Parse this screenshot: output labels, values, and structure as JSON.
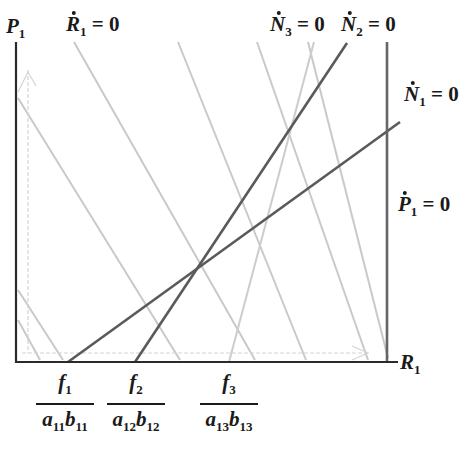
{
  "axes": {
    "y_label": "P",
    "y_label_sub": "1",
    "x_label": "R",
    "x_label_sub": "1"
  },
  "isoclines": {
    "r1": {
      "var": "R",
      "sub": "1",
      "eq": " = 0"
    },
    "n3": {
      "var": "N",
      "sub": "3",
      "eq": " = 0"
    },
    "n2": {
      "var": "N",
      "sub": "2",
      "eq": " = 0"
    },
    "n1": {
      "var": "N",
      "sub": "1",
      "eq": " = 0"
    },
    "p1": {
      "var": "P",
      "sub": "1",
      "eq": " = 0"
    }
  },
  "x_ticks": [
    {
      "num": "f",
      "num_sub": "1",
      "den_a": "a",
      "den_a_sub": "11",
      "den_b": "b",
      "den_b_sub": "11"
    },
    {
      "num": "f",
      "num_sub": "2",
      "den_a": "a",
      "den_a_sub": "12",
      "den_b": "b",
      "den_b_sub": "12"
    },
    {
      "num": "f",
      "num_sub": "3",
      "den_a": "a",
      "den_a_sub": "13",
      "den_b": "b",
      "den_b_sub": "13"
    }
  ],
  "colors": {
    "axis": "#2a2a2a",
    "dark_line": "#555555",
    "light_line": "#c8c8c8",
    "dashed": "#d0d0d0",
    "text": "#1a1a1a"
  }
}
